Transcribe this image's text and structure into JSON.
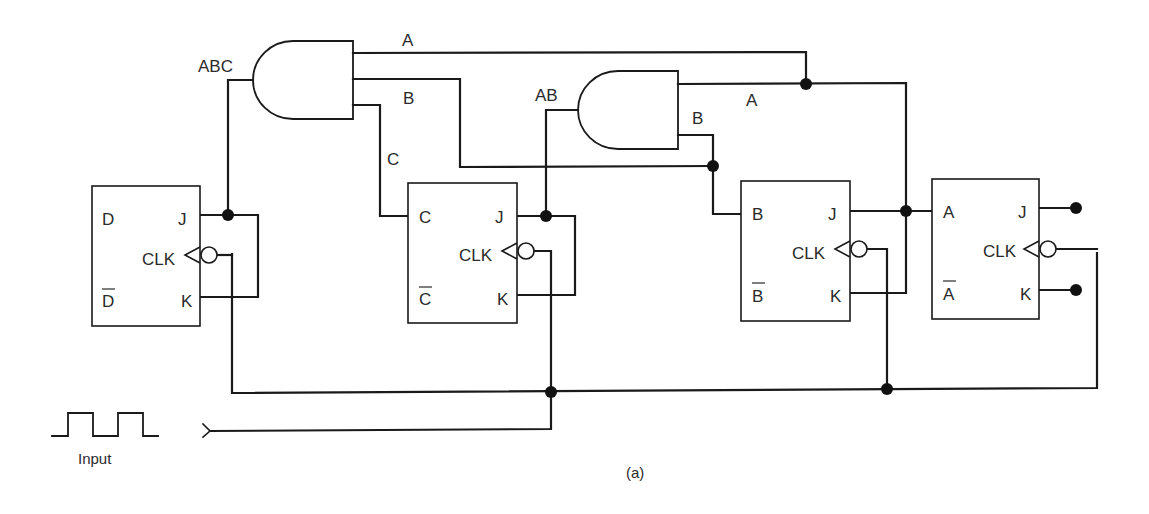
{
  "diagram": {
    "caption": "(a)",
    "input_label": "Input",
    "gates": [
      {
        "id": "and_abc",
        "type": "AND",
        "output_label": "ABC",
        "input_labels": [
          "A",
          "B",
          "C"
        ]
      },
      {
        "id": "and_ab",
        "type": "AND",
        "output_label": "AB",
        "input_labels": [
          "A",
          "B"
        ]
      }
    ],
    "flip_flops": [
      {
        "id": "ff_d",
        "type": "JK",
        "q": "D",
        "q_bar": "D",
        "j": "J",
        "k": "K",
        "clk": "CLK"
      },
      {
        "id": "ff_c",
        "type": "JK",
        "q": "C",
        "q_bar": "C",
        "j": "J",
        "k": "K",
        "clk": "CLK"
      },
      {
        "id": "ff_b",
        "type": "JK",
        "q": "B",
        "q_bar": "B",
        "j": "J",
        "k": "K",
        "clk": "CLK"
      },
      {
        "id": "ff_a",
        "type": "JK",
        "q": "A",
        "q_bar": "A",
        "j": "J",
        "k": "K",
        "clk": "CLK"
      }
    ],
    "constants": {
      "ff_a_j": "1",
      "ff_a_k": "1"
    },
    "wire_labels": {
      "gate1_in_a": "A",
      "gate1_in_b": "B",
      "gate1_in_c": "C",
      "gate2_in_a": "A",
      "gate2_in_b": "B"
    },
    "colors": {
      "line": "#1a1a1a",
      "text": "#2a2a2a",
      "background": "#ffffff"
    }
  }
}
